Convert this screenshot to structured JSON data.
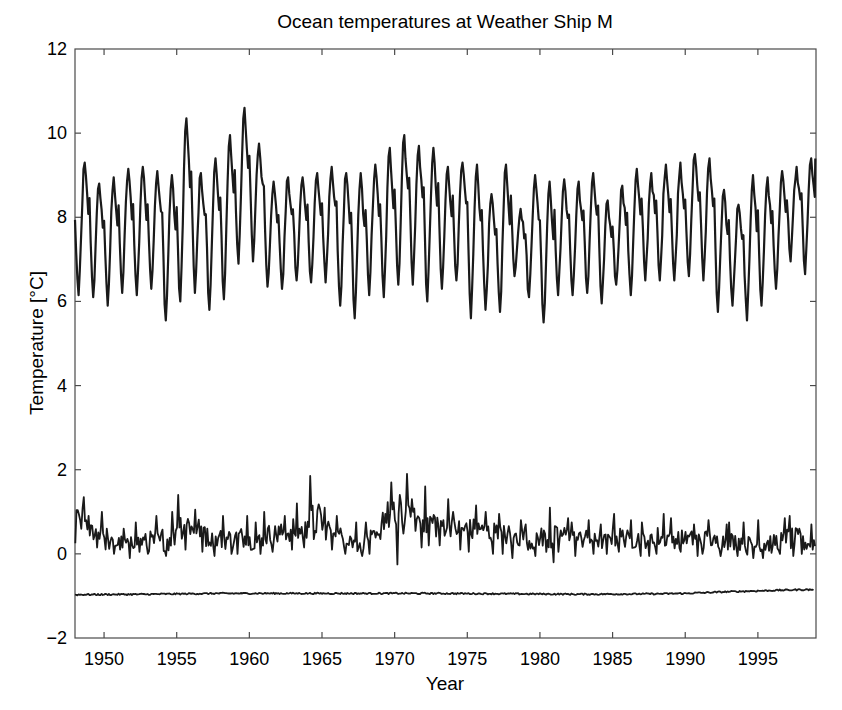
{
  "chart_data": {
    "type": "line",
    "title": "Ocean temperatures at Weather Ship M",
    "xlabel": "Year",
    "ylabel": "Temperature [°C]",
    "xlim": [
      1948.0,
      1999.0
    ],
    "ylim": [
      -2,
      12
    ],
    "xticks": [
      1950,
      1955,
      1960,
      1965,
      1970,
      1975,
      1980,
      1985,
      1990,
      1995
    ],
    "yticks": [
      -2,
      0,
      2,
      4,
      6,
      8,
      10,
      12
    ],
    "grid": false,
    "legend": null,
    "line_color": "#1a1a1a",
    "series": [
      {
        "name": "surface",
        "description": "Upper series, strong annual cycle; annual maxima (late summer) and minima (early spring)",
        "years": [
          1948,
          1949,
          1950,
          1951,
          1952,
          1953,
          1954,
          1955,
          1956,
          1957,
          1958,
          1959,
          1960,
          1961,
          1962,
          1963,
          1964,
          1965,
          1966,
          1967,
          1968,
          1969,
          1970,
          1971,
          1972,
          1973,
          1974,
          1975,
          1976,
          1977,
          1978,
          1979,
          1980,
          1981,
          1982,
          1983,
          1984,
          1985,
          1986,
          1987,
          1988,
          1989,
          1990,
          1991,
          1992,
          1993,
          1994,
          1995,
          1996,
          1997,
          1998
        ],
        "annual_max": [
          9.3,
          8.8,
          8.95,
          9.15,
          9.2,
          9.1,
          9.0,
          10.35,
          9.05,
          9.4,
          9.95,
          10.6,
          9.75,
          8.85,
          8.95,
          8.95,
          9.05,
          9.2,
          9.05,
          9.05,
          9.25,
          9.65,
          9.95,
          9.7,
          9.65,
          9.2,
          9.3,
          9.25,
          8.55,
          9.25,
          8.2,
          9.0,
          8.85,
          8.9,
          8.85,
          9.05,
          8.4,
          8.75,
          9.15,
          9.05,
          9.25,
          9.3,
          9.5,
          9.4,
          8.65,
          8.3,
          9.0,
          8.95,
          9.1,
          9.2,
          9.4
        ],
        "annual_min": [
          6.15,
          6.1,
          5.9,
          6.2,
          6.15,
          6.3,
          5.55,
          6.0,
          6.2,
          5.8,
          6.05,
          6.9,
          6.95,
          6.35,
          6.3,
          6.5,
          6.45,
          6.45,
          5.9,
          5.6,
          6.15,
          6.1,
          6.4,
          6.4,
          6.0,
          6.3,
          6.5,
          5.6,
          5.8,
          5.75,
          6.6,
          6.1,
          5.5,
          6.15,
          6.15,
          6.2,
          5.95,
          6.4,
          6.15,
          6.5,
          6.5,
          6.5,
          6.6,
          6.5,
          5.75,
          5.9,
          5.55,
          5.9,
          6.3,
          6.95,
          6.65
        ],
        "start_value": 8.6,
        "end_value": 9.4
      },
      {
        "name": "intermediate",
        "description": "Middle series, noisy around 0-1 degC",
        "years": [
          1948,
          1949,
          1950,
          1951,
          1952,
          1953,
          1954,
          1955,
          1956,
          1957,
          1958,
          1959,
          1960,
          1961,
          1962,
          1963,
          1964,
          1965,
          1966,
          1967,
          1968,
          1969,
          1970,
          1971,
          1972,
          1973,
          1974,
          1975,
          1976,
          1977,
          1978,
          1979,
          1980,
          1981,
          1982,
          1983,
          1984,
          1985,
          1986,
          1987,
          1988,
          1989,
          1990,
          1991,
          1992,
          1993,
          1994,
          1995,
          1996,
          1997,
          1998
        ],
        "annual_mean": [
          0.8,
          0.55,
          0.25,
          0.25,
          0.3,
          0.3,
          0.35,
          0.7,
          0.6,
          0.35,
          0.35,
          0.4,
          0.3,
          0.45,
          0.5,
          0.55,
          0.8,
          0.6,
          0.4,
          0.25,
          0.35,
          0.9,
          0.85,
          0.8,
          0.75,
          0.7,
          0.6,
          0.55,
          0.5,
          0.45,
          0.4,
          0.3,
          0.35,
          0.45,
          0.35,
          0.35,
          0.3,
          0.4,
          0.35,
          0.35,
          0.4,
          0.35,
          0.35,
          0.35,
          0.3,
          0.3,
          0.2,
          0.25,
          0.3,
          0.35,
          0.25
        ],
        "annual_max": [
          1.35,
          1.0,
          0.6,
          0.6,
          0.75,
          0.9,
          1.0,
          1.4,
          1.05,
          0.6,
          0.9,
          0.9,
          0.75,
          1.0,
          0.9,
          1.2,
          1.85,
          1.1,
          0.9,
          0.75,
          0.75,
          1.7,
          1.9,
          1.3,
          1.6,
          1.3,
          1.0,
          1.15,
          1.0,
          0.95,
          0.8,
          0.7,
          1.1,
          0.85,
          0.75,
          0.8,
          0.7,
          0.95,
          0.8,
          0.75,
          0.95,
          0.85,
          0.7,
          0.8,
          0.7,
          0.75,
          0.75,
          0.8,
          0.85,
          0.9,
          0.7
        ],
        "annual_min": [
          0.25,
          0.15,
          0.0,
          -0.1,
          0.05,
          0.0,
          -0.05,
          0.1,
          0.05,
          -0.05,
          0.0,
          0.0,
          0.0,
          0.05,
          0.1,
          0.15,
          0.35,
          0.1,
          0.0,
          -0.05,
          0.0,
          0.35,
          -0.25,
          0.15,
          0.2,
          0.2,
          0.1,
          0.05,
          0.0,
          0.0,
          -0.1,
          -0.05,
          -0.2,
          0.05,
          -0.05,
          0.0,
          0.0,
          0.05,
          -0.05,
          -0.05,
          0.0,
          0.05,
          -0.05,
          0.0,
          -0.05,
          -0.05,
          -0.1,
          -0.1,
          0.0,
          -0.05,
          0.0
        ]
      },
      {
        "name": "deep",
        "description": "Bottom series, nearly constant near -0.95 degC, slight warming to about -0.85 by 1998",
        "years": [
          1948,
          1953,
          1958,
          1963,
          1968,
          1973,
          1978,
          1983,
          1988,
          1990,
          1993,
          1995,
          1998
        ],
        "values": [
          -0.97,
          -0.96,
          -0.94,
          -0.94,
          -0.94,
          -0.94,
          -0.95,
          -0.96,
          -0.95,
          -0.94,
          -0.9,
          -0.88,
          -0.85
        ]
      }
    ]
  },
  "plot": {
    "left": 75,
    "right": 816,
    "top": 49,
    "bottom": 638
  }
}
